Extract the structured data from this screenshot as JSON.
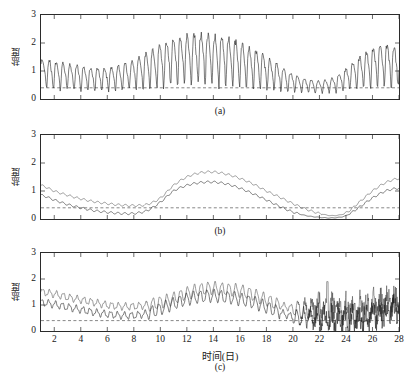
{
  "figure": {
    "axis_label_y": "盐度",
    "axis_label_x": "时间(日)",
    "y_ticks": [
      "0",
      "1",
      "2",
      "3"
    ],
    "x_ticks": [
      "2",
      "4",
      "6",
      "8",
      "10",
      "12",
      "14",
      "16",
      "18",
      "20",
      "22",
      "24",
      "26",
      "28"
    ],
    "panel_labels": {
      "a": "(a)",
      "b": "(b)",
      "c": "(c)"
    },
    "colors": {
      "curve_dark": "#232323",
      "curve_light": "#4a4a4a",
      "threshold": "#555555",
      "axis": "#2b2b2b",
      "background": "#ffffff"
    }
  },
  "chart_data": [
    {
      "type": "line",
      "panel": "(a)",
      "title": "",
      "xlabel": "",
      "ylabel": "盐度",
      "xlim": [
        1,
        28
      ],
      "ylim": [
        0,
        3
      ],
      "ytick_values": [
        0,
        1,
        2,
        3
      ],
      "xtick_values": [
        2,
        4,
        6,
        8,
        10,
        12,
        14,
        16,
        18,
        20,
        22,
        24,
        26,
        28
      ],
      "grid": false,
      "legend": "none",
      "annotations": [
        {
          "kind": "threshold-line",
          "style": "dashed",
          "y": 0.4
        }
      ],
      "description": "高频潮汐振荡原始盐度序列，包络呈双峰",
      "envelope_mean": {
        "x": [
          1,
          2,
          3,
          4,
          5,
          6,
          7,
          8,
          9,
          10,
          11,
          12,
          13,
          14,
          15,
          16,
          17,
          18,
          19,
          20,
          21,
          22,
          23,
          24,
          25,
          26,
          27,
          28
        ],
        "values": [
          1.05,
          1.0,
          0.95,
          0.9,
          0.85,
          0.85,
          0.92,
          1.05,
          1.25,
          1.5,
          1.72,
          1.85,
          1.9,
          1.88,
          1.8,
          1.65,
          1.45,
          1.2,
          0.95,
          0.72,
          0.58,
          0.52,
          0.6,
          0.85,
          1.15,
          1.4,
          1.5,
          1.45
        ]
      },
      "envelope_upper": {
        "x": [
          1,
          2,
          3,
          4,
          5,
          6,
          7,
          8,
          9,
          10,
          11,
          12,
          13,
          14,
          15,
          16,
          17,
          18,
          19,
          20,
          21,
          22,
          23,
          24,
          25,
          26,
          27,
          28
        ],
        "values": [
          1.6,
          1.5,
          1.4,
          1.3,
          1.25,
          1.25,
          1.35,
          1.55,
          1.85,
          2.15,
          2.4,
          2.55,
          2.6,
          2.55,
          2.45,
          2.25,
          2.0,
          1.7,
          1.35,
          1.0,
          0.8,
          0.72,
          0.85,
          1.2,
          1.65,
          2.0,
          2.15,
          2.05
        ]
      },
      "envelope_lower": {
        "x": [
          1,
          2,
          3,
          4,
          5,
          6,
          7,
          8,
          9,
          10,
          11,
          12,
          13,
          14,
          15,
          16,
          17,
          18,
          19,
          20,
          21,
          22,
          23,
          24,
          25,
          26,
          27,
          28
        ],
        "values": [
          0.45,
          0.4,
          0.38,
          0.35,
          0.32,
          0.32,
          0.35,
          0.4,
          0.45,
          0.5,
          0.55,
          0.58,
          0.6,
          0.58,
          0.55,
          0.5,
          0.45,
          0.4,
          0.35,
          0.3,
          0.25,
          0.22,
          0.25,
          0.35,
          0.45,
          0.5,
          0.52,
          0.5
        ]
      },
      "oscillation_period_days": 0.52,
      "n_points": 672
    },
    {
      "type": "line",
      "panel": "(b)",
      "title": "",
      "xlabel": "",
      "ylabel": "盐度",
      "xlim": [
        1,
        28
      ],
      "ylim": [
        0,
        3
      ],
      "ytick_values": [
        0,
        1,
        2,
        3
      ],
      "xtick_values": [
        2,
        4,
        6,
        8,
        10,
        12,
        14,
        16,
        18,
        20,
        22,
        24,
        26,
        28
      ],
      "grid": false,
      "legend": "none",
      "annotations": [
        {
          "kind": "threshold-line",
          "style": "dashed",
          "y": 0.4
        }
      ],
      "description": "平滑后两条包络曲线（上、下）带小幅纹波",
      "series": [
        {
          "name": "上包络",
          "x": [
            1,
            2,
            3,
            4,
            5,
            6,
            7,
            8,
            9,
            10,
            11,
            12,
            13,
            14,
            15,
            16,
            17,
            18,
            19,
            20,
            21,
            22,
            23,
            24,
            25,
            26,
            27,
            28
          ],
          "values": [
            1.2,
            1.0,
            0.85,
            0.72,
            0.62,
            0.55,
            0.5,
            0.48,
            0.52,
            0.75,
            1.2,
            1.5,
            1.65,
            1.68,
            1.6,
            1.45,
            1.25,
            1.0,
            0.78,
            0.55,
            0.35,
            0.2,
            0.12,
            0.22,
            0.6,
            1.0,
            1.3,
            1.45
          ]
        },
        {
          "name": "下包络",
          "x": [
            1,
            2,
            3,
            4,
            5,
            6,
            7,
            8,
            9,
            10,
            11,
            12,
            13,
            14,
            15,
            16,
            17,
            18,
            19,
            20,
            21,
            22,
            23,
            24,
            25,
            26,
            27,
            28
          ],
          "values": [
            0.85,
            0.68,
            0.52,
            0.4,
            0.3,
            0.24,
            0.2,
            0.2,
            0.3,
            0.6,
            1.0,
            1.2,
            1.3,
            1.32,
            1.25,
            1.1,
            0.9,
            0.68,
            0.45,
            0.25,
            0.12,
            0.06,
            0.04,
            0.12,
            0.42,
            0.75,
            1.0,
            1.1
          ]
        }
      ],
      "ripple_amplitude": 0.035,
      "ripple_period_days": 0.52
    },
    {
      "type": "line",
      "panel": "(c)",
      "title": "",
      "xlabel": "时间(日)",
      "ylabel": "盐度",
      "xlim": [
        1,
        28
      ],
      "ylim": [
        0,
        3
      ],
      "ytick_values": [
        0,
        1,
        2,
        3
      ],
      "xtick_values": [
        2,
        4,
        6,
        8,
        10,
        12,
        14,
        16,
        18,
        20,
        22,
        24,
        26,
        28
      ],
      "grid": false,
      "legend": "none",
      "annotations": [
        {
          "kind": "threshold-line",
          "style": "dashed",
          "y": 0.4
        },
        {
          "kind": "spike",
          "x": 22.6,
          "y": 1.9
        }
      ],
      "description": "重构序列，两条带振荡曲线，20-28日段噪声增大",
      "series": [
        {
          "name": "上曲线",
          "x": [
            1,
            2,
            3,
            4,
            5,
            6,
            7,
            8,
            9,
            10,
            11,
            12,
            13,
            14,
            15,
            16,
            17,
            18,
            19,
            20,
            21,
            22,
            23,
            24,
            25,
            26,
            27,
            28
          ],
          "values": [
            1.5,
            1.42,
            1.3,
            1.2,
            1.1,
            1.0,
            0.95,
            0.95,
            1.0,
            1.1,
            1.25,
            1.45,
            1.6,
            1.65,
            1.6,
            1.55,
            1.4,
            1.2,
            1.0,
            0.88,
            0.85,
            0.95,
            0.9,
            0.85,
            0.9,
            1.0,
            1.1,
            1.3
          ]
        },
        {
          "name": "下曲线",
          "x": [
            1,
            2,
            3,
            4,
            5,
            6,
            7,
            8,
            9,
            10,
            11,
            12,
            13,
            14,
            15,
            16,
            17,
            18,
            19,
            20,
            21,
            22,
            23,
            24,
            25,
            26,
            27,
            28
          ],
          "values": [
            1.1,
            1.02,
            0.92,
            0.82,
            0.72,
            0.65,
            0.6,
            0.6,
            0.68,
            0.85,
            1.05,
            1.22,
            1.32,
            1.35,
            1.3,
            1.22,
            1.1,
            0.92,
            0.72,
            0.55,
            0.48,
            0.52,
            0.48,
            0.45,
            0.5,
            0.6,
            0.72,
            0.95
          ]
        }
      ],
      "ripple_amplitude": 0.12,
      "ripple_period_days": 0.52,
      "noise_region": [
        20,
        28
      ]
    }
  ]
}
